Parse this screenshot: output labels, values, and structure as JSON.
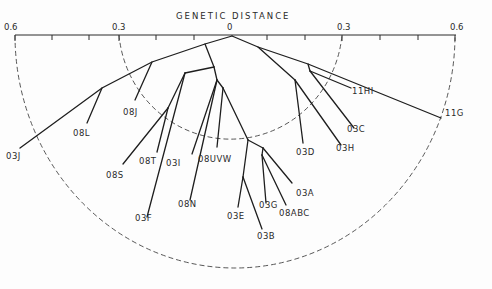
{
  "title": "GENETIC DISTANCE",
  "axis": {
    "ticks": [
      {
        "label": "0.6",
        "x": 4
      },
      {
        "label": "0.3",
        "x": 112
      },
      {
        "label": "0",
        "x": 227
      },
      {
        "label": "0.3",
        "x": 337
      },
      {
        "label": "0.6",
        "x": 450
      }
    ]
  },
  "leaves": [
    {
      "label": "03J",
      "x": 6,
      "y": 151
    },
    {
      "label": "08L",
      "x": 73,
      "y": 128
    },
    {
      "label": "08J",
      "x": 123,
      "y": 107
    },
    {
      "label": "08S",
      "x": 106,
      "y": 170
    },
    {
      "label": "08T",
      "x": 139,
      "y": 156
    },
    {
      "label": "03I",
      "x": 166,
      "y": 158
    },
    {
      "label": "08UVW",
      "x": 198,
      "y": 154
    },
    {
      "label": "08N",
      "x": 178,
      "y": 199
    },
    {
      "label": "03F",
      "x": 135,
      "y": 213
    },
    {
      "label": "03E",
      "x": 227,
      "y": 211
    },
    {
      "label": "03B",
      "x": 257,
      "y": 231
    },
    {
      "label": "03G",
      "x": 259,
      "y": 200
    },
    {
      "label": "08ABC",
      "x": 279,
      "y": 208
    },
    {
      "label": "03A",
      "x": 296,
      "y": 188
    },
    {
      "label": "03D",
      "x": 296,
      "y": 147
    },
    {
      "label": "03H",
      "x": 336,
      "y": 143
    },
    {
      "label": "03C",
      "x": 347,
      "y": 124
    },
    {
      "label": "11HI",
      "x": 352,
      "y": 86
    },
    {
      "label": "11G",
      "x": 445,
      "y": 108
    }
  ]
}
